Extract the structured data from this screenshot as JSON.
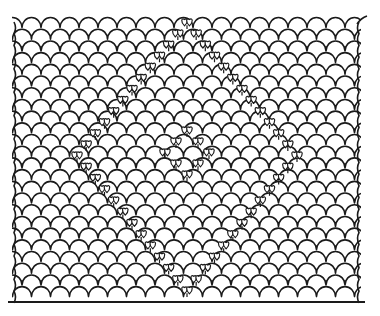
{
  "figure": {
    "stroke_color": "#1a1a1a",
    "background_color": "#ffffff"
  },
  "pattern": {
    "origin_x": 22,
    "origin_y": 18,
    "scale_width": 19,
    "row_height": 11.7,
    "rows": 24,
    "cols": 19,
    "left_edge_x": 12,
    "right_edge_x": 361,
    "baseline": {
      "x1": 8,
      "x2": 365,
      "y": 302
    }
  },
  "motifs": {
    "outer_diamond": {
      "top": [
        187,
        22
      ],
      "left": [
        77,
        155
      ],
      "bottom": [
        187,
        290
      ],
      "right": [
        297,
        155
      ],
      "steps_per_side": 12
    },
    "inner_diamond": {
      "top": [
        187,
        130
      ],
      "left": [
        165,
        152
      ],
      "bottom": [
        187,
        174
      ],
      "right": [
        209,
        152
      ],
      "steps_per_side": 2
    },
    "heart_size": 7
  }
}
